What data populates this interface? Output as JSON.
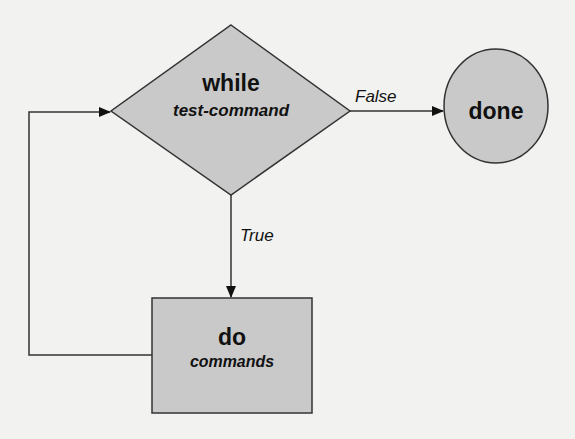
{
  "diagram": {
    "type": "flowchart",
    "colors": {
      "background": "#f2f2f0",
      "shape_fill": "#c9c9c9",
      "stroke": "#333333",
      "text": "#111111"
    },
    "decision": {
      "keyword": "while",
      "detail": "test-command"
    },
    "terminal": {
      "label": "done"
    },
    "process": {
      "keyword": "do",
      "detail": "commands"
    },
    "edges": {
      "false_label": "False",
      "true_label": "True"
    }
  }
}
